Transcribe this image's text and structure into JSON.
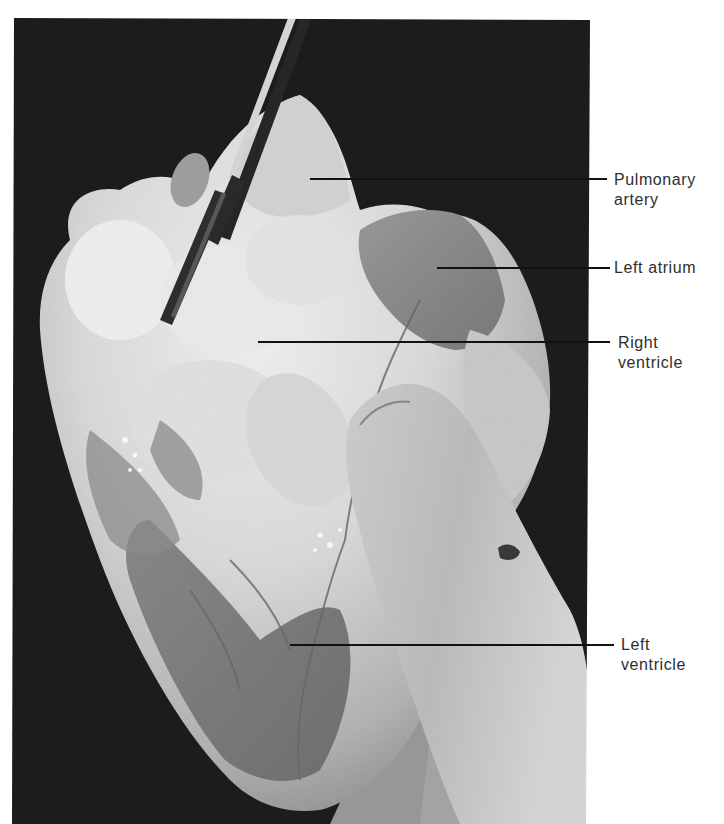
{
  "figure": {
    "colors": {
      "background": "#ffffff",
      "photo_background": "#1c1c1c",
      "tissue_light": "#e8e8e8",
      "tissue_mid": "#a8a8a8",
      "tissue_dark": "#6e6e6e",
      "leader_line": "#111111",
      "label_text": "#2e2e2e"
    },
    "labels": [
      {
        "id": "pulmonary-artery",
        "lines": [
          "Pulmonary",
          "artery"
        ],
        "line_y": 179,
        "line_x_start": 310
      },
      {
        "id": "left-atrium",
        "lines": [
          "Left atrium"
        ],
        "line_y": 268,
        "line_x_start": 437
      },
      {
        "id": "right-ventricle",
        "lines": [
          "Right",
          "ventricle"
        ],
        "line_y": 342,
        "line_x_start": 258
      },
      {
        "id": "left-ventricle",
        "lines": [
          "Left",
          "ventricle"
        ],
        "line_y": 645,
        "line_x_start": 290
      }
    ]
  }
}
